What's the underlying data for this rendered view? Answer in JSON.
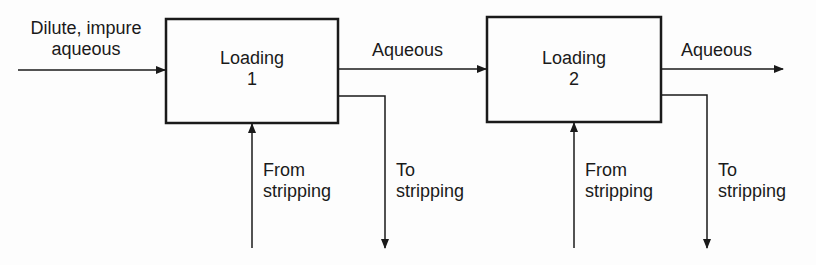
{
  "diagram": {
    "type": "process-flow",
    "stages": [
      {
        "title": "Loading",
        "number": "1"
      },
      {
        "title": "Loading",
        "number": "2"
      }
    ],
    "feed": {
      "line1": "Dilute, impure",
      "line2": "aqueous"
    },
    "interstage_label": "Aqueous",
    "outlet_label": "Aqueous",
    "from_stripping": {
      "line1": "From",
      "line2": "stripping"
    },
    "to_stripping": {
      "line1": "To",
      "line2": "stripping"
    },
    "colors": {
      "line": "#1a1a1a",
      "background": "#fdfdfd"
    }
  }
}
